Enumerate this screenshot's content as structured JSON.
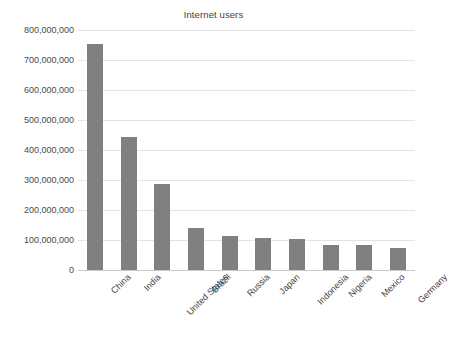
{
  "chart_data": {
    "type": "bar",
    "title": "Internet users",
    "xlabel": "",
    "ylabel": "",
    "categories": [
      "China",
      "India",
      "United States",
      "Brazil",
      "Russia",
      "Japan",
      "Indonesia",
      "Nigeria",
      "Mexico",
      "Germany"
    ],
    "values": [
      753000000,
      443000000,
      287000000,
      140000000,
      115000000,
      107000000,
      104000000,
      85000000,
      82000000,
      72000000
    ],
    "ylim": [
      0,
      800000000
    ],
    "ytick_values": [
      0,
      100000000,
      200000000,
      300000000,
      400000000,
      500000000,
      600000000,
      700000000,
      800000000
    ],
    "ytick_labels": [
      "0",
      "100,000,000",
      "200,000,000",
      "300,000,000",
      "400,000,000",
      "500,000,000",
      "600,000,000",
      "700,000,000",
      "800,000,000"
    ],
    "grid": true,
    "legend": false,
    "legend_position": "none",
    "bar_color": "#808080",
    "background_color": "#ffffff",
    "gridline_color": "#e3e3e3",
    "axis_color": "#c9c9c9",
    "xtick_label_rotation": -45
  }
}
